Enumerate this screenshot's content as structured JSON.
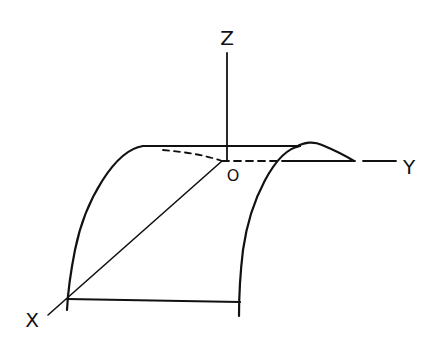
{
  "diagram": {
    "ink_color": "#111111",
    "background": "#ffffff",
    "labels": {
      "z_axis": "Z",
      "y_axis": "Y",
      "x_axis": "X",
      "origin": "O"
    }
  }
}
